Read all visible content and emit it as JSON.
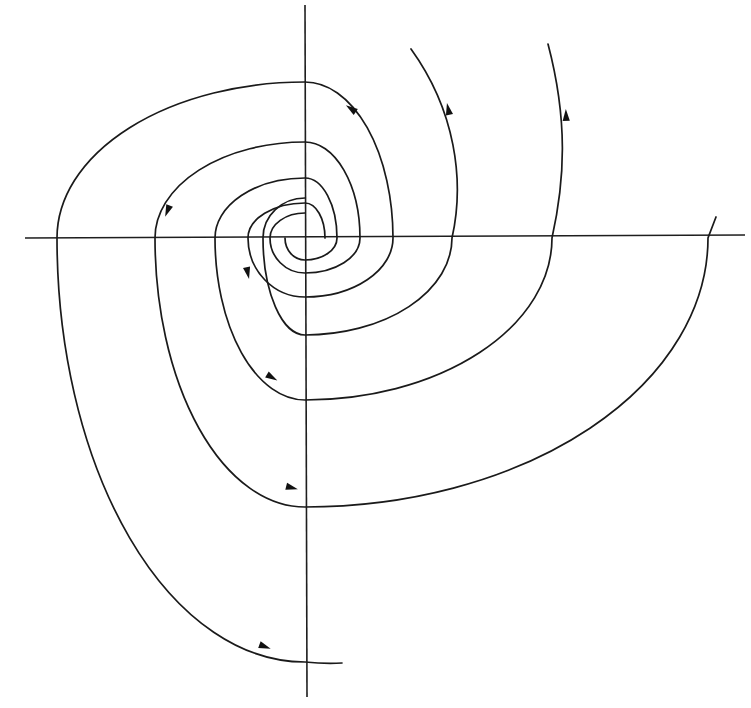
{
  "figure": {
    "type": "phase-portrait",
    "colors": {
      "background": "#ffffff",
      "ink": "#1a1a1a"
    },
    "origin": {
      "x": 305,
      "y": 238
    }
  },
  "axes": {
    "horizontal": {
      "x1": "25",
      "y1": "238",
      "x2": "745",
      "y2": "235"
    },
    "vertical": {
      "x1": "305",
      "y1": "5",
      "x2": "307",
      "y2": "697"
    }
  },
  "trajectories": [
    {
      "name": "trajectory-to-bottom-end",
      "d": "M325,238 A20,35 0 0 0 305,203 A57,35 0 0 0 248,238 A57,59 0 0 0 305,297 A88,59 0 0 0 393,238 A88,156 0 0 0 305,82 A248,156 0 0 0 57,238 A248,424 0 0 0 305,662 Q325,664 342,663"
    },
    {
      "name": "trajectory-to-top-end-548",
      "d": "M285,238 A20,22 0 0 0 305,260 A32,22 0 0 0 337,238 A32,60 0 0 0 305,178 A90,60 0 0 0 215,238 A90,162 0 0 0 305,400 A247,162 0 0 0 552,238 C565,180 568,120 548,44"
    },
    {
      "name": "trajectory-to-right-end-716",
      "d": "M305,213 A35,25 0 0 0 270,238 A35,35 0 0 0 305,273 A55,35 0 0 0 360,238 A55,96 0 0 0 305,142 A150,96 0 0 0 155,238 A150,269 0 0 0 305,507 A403,269 0 0 0 708,238 L716,217"
    },
    {
      "name": "trajectory-to-top-end-411",
      "d": "M305,198 A42,40 0 0 0 263,238 A42,97 0 0 0 305,335 A147,97 0 0 0 452,238 C465,180 455,110 411,49"
    }
  ],
  "arrows": [
    {
      "x": 350,
      "y": 108,
      "direction": "up-left",
      "transform": "translate(350,108) rotate(215)"
    },
    {
      "x": 447,
      "y": 112,
      "direction": "up",
      "transform": "translate(448,108) rotate(258)"
    },
    {
      "x": 567,
      "y": 118,
      "direction": "up",
      "transform": "translate(566,114) rotate(268)"
    },
    {
      "x": 168,
      "y": 210,
      "direction": "down",
      "transform": "translate(167,212) rotate(112)"
    },
    {
      "x": 248,
      "y": 272,
      "direction": "down",
      "transform": "translate(248,274) rotate(78)"
    },
    {
      "x": 272,
      "y": 378,
      "direction": "down-right",
      "transform": "translate(273,378) rotate(30)"
    },
    {
      "x": 292,
      "y": 488,
      "direction": "right",
      "transform": "translate(293,488) rotate(14)"
    },
    {
      "x": 265,
      "y": 647,
      "direction": "right",
      "transform": "translate(266,647) rotate(20)"
    }
  ],
  "trajectory_ends": [
    {
      "x": 342,
      "y": 663
    },
    {
      "x": 411,
      "y": 49
    },
    {
      "x": 548,
      "y": 44
    },
    {
      "x": 716,
      "y": 217
    }
  ]
}
